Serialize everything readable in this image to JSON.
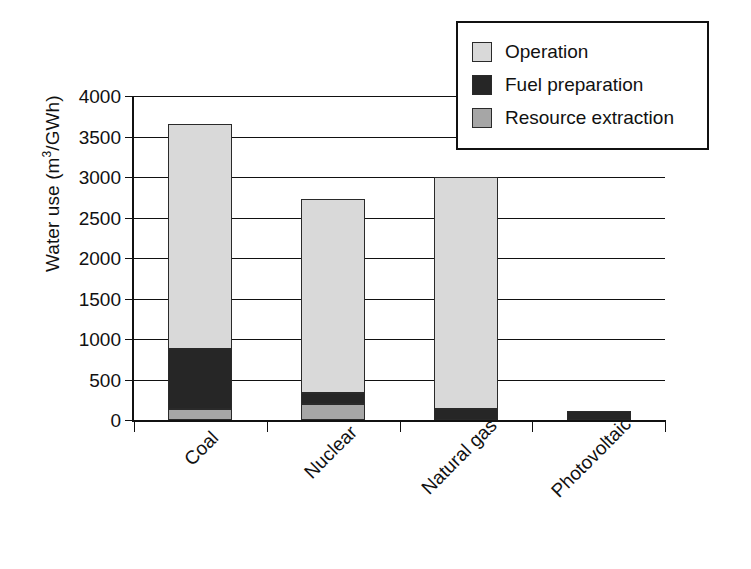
{
  "chart_data": {
    "type": "bar",
    "subtype": "stacked-bar",
    "title": "",
    "xlabel": "",
    "ylabel": "Water use (m3/GWh)",
    "ylabel_parts": {
      "prefix": "Water use (m",
      "sup": "3",
      "suffix": "/GWh)"
    },
    "categories": [
      "Coal",
      "Nuclear",
      "Natural gas",
      "Photovoltaic"
    ],
    "series": [
      {
        "name": "Operation",
        "color": "#d9d9d9",
        "values": [
          2780,
          2400,
          2865,
          0
        ]
      },
      {
        "name": "Fuel preparation",
        "color": "#262626",
        "values": [
          740,
          130,
          135,
          110
        ]
      },
      {
        "name": "Resource extraction",
        "color": "#a6a6a6",
        "values": [
          140,
          200,
          0,
          0
        ]
      }
    ],
    "stack_order_bottom_to_top": [
      "Resource extraction",
      "Fuel preparation",
      "Operation"
    ],
    "totals": [
      3660,
      2730,
      3000,
      110
    ],
    "ylim": [
      0,
      4000
    ],
    "ytick_values": [
      0,
      500,
      1000,
      1500,
      2000,
      2500,
      3000,
      3500,
      4000
    ],
    "ytick_labels": [
      "0",
      "500",
      "1000",
      "1500",
      "2000",
      "2500",
      "3000",
      "3500",
      "4000"
    ],
    "grid": "horizontal",
    "legend_position": "top-right",
    "legend_entries": [
      "Operation",
      "Fuel preparation",
      "Resource extraction"
    ]
  },
  "legend": {
    "items": [
      {
        "label": "Operation",
        "swatch": "operation-swatch"
      },
      {
        "label": "Fuel preparation",
        "swatch": "fuel-preparation-swatch"
      },
      {
        "label": "Resource extraction",
        "swatch": "resource-extraction-swatch"
      }
    ]
  },
  "axis": {
    "y_title_prefix": "Water use (m",
    "y_title_sup": "3",
    "y_title_suffix": "/GWh)",
    "ticks": [
      {
        "label": "4000",
        "value": 4000
      },
      {
        "label": "3500",
        "value": 3500
      },
      {
        "label": "3000",
        "value": 3000
      },
      {
        "label": "2500",
        "value": 2500
      },
      {
        "label": "2000",
        "value": 2000
      },
      {
        "label": "1500",
        "value": 1500
      },
      {
        "label": "1000",
        "value": 1000
      },
      {
        "label": "500",
        "value": 500
      },
      {
        "label": "0",
        "value": 0
      }
    ]
  },
  "bars": [
    {
      "category": "Coal",
      "segments": [
        {
          "name": "Operation",
          "value": 2780,
          "cls": "seg-operation"
        },
        {
          "name": "Fuel preparation",
          "value": 740,
          "cls": "seg-fuel"
        },
        {
          "name": "Resource extraction",
          "value": 140,
          "cls": "seg-resource"
        }
      ]
    },
    {
      "category": "Nuclear",
      "segments": [
        {
          "name": "Operation",
          "value": 2400,
          "cls": "seg-operation"
        },
        {
          "name": "Fuel preparation",
          "value": 130,
          "cls": "seg-fuel"
        },
        {
          "name": "Resource extraction",
          "value": 200,
          "cls": "seg-resource"
        }
      ]
    },
    {
      "category": "Natural gas",
      "segments": [
        {
          "name": "Operation",
          "value": 2865,
          "cls": "seg-operation"
        },
        {
          "name": "Fuel preparation",
          "value": 135,
          "cls": "seg-fuel"
        },
        {
          "name": "Resource extraction",
          "value": 0,
          "cls": "seg-resource"
        }
      ]
    },
    {
      "category": "Photovoltaic",
      "segments": [
        {
          "name": "Operation",
          "value": 0,
          "cls": "seg-operation"
        },
        {
          "name": "Fuel preparation",
          "value": 110,
          "cls": "seg-fuel"
        },
        {
          "name": "Resource extraction",
          "value": 0,
          "cls": "seg-resource"
        }
      ]
    }
  ]
}
